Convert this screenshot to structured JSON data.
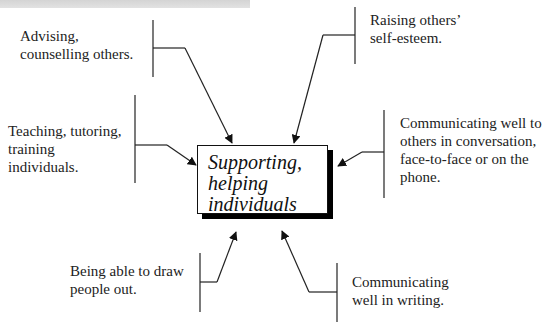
{
  "diagram": {
    "central_node": "Supporting,\nhelping\nindividuals",
    "nodes": [
      {
        "id": "advising",
        "text": "Advising,\ncounselling others."
      },
      {
        "id": "raising",
        "text": "Raising others’\nself-esteem."
      },
      {
        "id": "teaching",
        "text": "Teaching, tutoring,\ntraining\nindividuals."
      },
      {
        "id": "communicating-conversation",
        "text": "Communicating well to\nothers in conversation,\nface-to-face or on the\nphone."
      },
      {
        "id": "draw-out",
        "text": "Being able to draw\npeople out."
      },
      {
        "id": "writing",
        "text": "Communicating\nwell in writing."
      }
    ],
    "colors": {
      "line": "#222222",
      "shadow": "#000000",
      "header_band": "#d9d9d9"
    }
  }
}
